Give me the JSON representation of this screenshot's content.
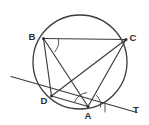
{
  "figure": {
    "kind": "circle-geometry-diagram",
    "width": 149,
    "height": 125,
    "background_color": "#ffffff",
    "ink_color": "#3a3a3f",
    "arc_color": "#4a4a50"
  },
  "circle": {
    "name": "main-circle",
    "center_x": 80,
    "center_y": 62,
    "radius": 47
  },
  "points": [
    {
      "id": "B",
      "label": "B",
      "x": 43.5,
      "y": 38.5,
      "label_x": 32,
      "label_y": 37
    },
    {
      "id": "C",
      "label": "C",
      "x": 126.0,
      "y": 39.5,
      "label_x": 133,
      "label_y": 38
    },
    {
      "id": "D",
      "label": "D",
      "x": 51.5,
      "y": 96.0,
      "label_x": 44,
      "label_y": 101
    },
    {
      "id": "A",
      "label": "A",
      "x": 88.0,
      "y": 106.5,
      "label_x": 88,
      "label_y": 116
    },
    {
      "id": "T",
      "label": "T",
      "x": 135.0,
      "y": 112.0,
      "label_x": 136,
      "label_y": 110
    }
  ],
  "segments": [
    {
      "name": "chord-BC",
      "from": "B",
      "to": "C",
      "x1": 43.5,
      "y1": 38.5,
      "x2": 126.0,
      "y2": 39.5
    },
    {
      "name": "chord-BD",
      "from": "B",
      "to": "D",
      "x1": 43.5,
      "y1": 38.5,
      "x2": 51.5,
      "y2": 96.0
    },
    {
      "name": "chord-BA",
      "from": "B",
      "to": "A",
      "x1": 43.5,
      "y1": 38.5,
      "x2": 88.0,
      "y2": 106.5
    },
    {
      "name": "chord-DC",
      "from": "D",
      "to": "C",
      "x1": 51.5,
      "y1": 96.0,
      "x2": 126.0,
      "y2": 39.5
    },
    {
      "name": "chord-AC",
      "from": "A",
      "to": "C",
      "x1": 88.0,
      "y1": 106.5,
      "x2": 126.0,
      "y2": 39.5
    },
    {
      "name": "chord-DA",
      "from": "D",
      "to": "A",
      "x1": 51.5,
      "y1": 96.0,
      "x2": 88.0,
      "y2": 106.5
    }
  ],
  "tangent": {
    "name": "tangent-line-at-A",
    "touch_point": "A",
    "end_label": "T",
    "x1": 11.0,
    "y1": 76.5,
    "x2": 137.0,
    "y2": 112.5
  },
  "angle_arcs": [
    {
      "name": "angle-arc-at-B",
      "vertex": "B",
      "path": "M 58.5 39.0 A 15 15 0 0 1 54.8 51.7"
    },
    {
      "name": "angle-arc-at-A-inner",
      "vertex": "A",
      "path": "M 74.4 102.7 A 14 14 0 0 1 86.6 92.6"
    },
    {
      "name": "angle-arc-at-A-outer",
      "vertex": "A",
      "path": "M 96.5 95.5 A 13 13 0 0 1 100.5 107.2"
    },
    {
      "name": "angle-arc-at-A-tangent",
      "vertex": "A",
      "path": "M 105.0 103.0 L 105.0 112.0"
    }
  ],
  "labels": {
    "B": "B",
    "C": "C",
    "D": "D",
    "A": "A",
    "T": "T"
  }
}
